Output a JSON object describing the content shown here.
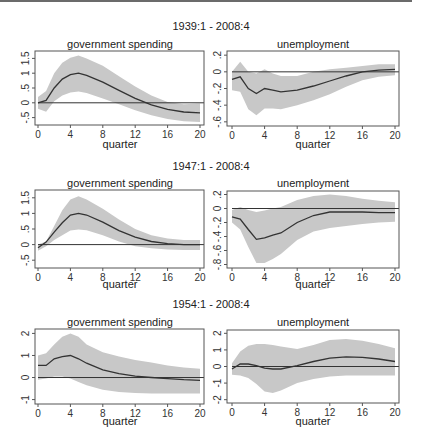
{
  "chart_data": [
    {
      "type": "line",
      "row_title": "1939:1 - 2008:4",
      "title": "government spending",
      "xlabel": "quarter",
      "ylabel": "",
      "x": [
        0,
        1,
        2,
        3,
        4,
        5,
        6,
        8,
        10,
        12,
        14,
        16,
        18,
        20
      ],
      "xticks": [
        "0",
        "4",
        "8",
        "12",
        "16",
        "20"
      ],
      "yticks": [
        1.5,
        1,
        0.5,
        0,
        -0.5
      ],
      "ytick_labels": [
        "1.5",
        "1",
        ".5",
        "0",
        "-.5"
      ],
      "ylim": [
        -0.75,
        1.75
      ],
      "zero_line": true,
      "series": [
        {
          "name": "response",
          "values": [
            0,
            0.08,
            0.5,
            0.8,
            0.95,
            1.0,
            0.93,
            0.7,
            0.42,
            0.15,
            -0.07,
            -0.22,
            -0.31,
            -0.34
          ]
        },
        {
          "name": "upper band",
          "values": [
            0.2,
            0.4,
            1.0,
            1.35,
            1.52,
            1.6,
            1.5,
            1.25,
            0.9,
            0.55,
            0.25,
            0.03,
            -0.05,
            -0.02
          ]
        },
        {
          "name": "lower band",
          "values": [
            -0.2,
            -0.3,
            0.05,
            0.25,
            0.35,
            0.38,
            0.33,
            0.15,
            -0.05,
            -0.25,
            -0.42,
            -0.55,
            -0.62,
            -0.65
          ]
        }
      ]
    },
    {
      "type": "line",
      "row_title": "1939:1 - 2008:4",
      "title": "unemployment",
      "xlabel": "quarter",
      "ylabel": "",
      "x": [
        0,
        1,
        2,
        3,
        4,
        5,
        6,
        8,
        10,
        12,
        14,
        16,
        18,
        20
      ],
      "xticks": [
        "0",
        "4",
        "8",
        "12",
        "16",
        "20"
      ],
      "yticks": [
        0.2,
        0,
        -0.2,
        -0.4,
        -0.6
      ],
      "ytick_labels": [
        ".2",
        "0",
        "-.2",
        "-.4",
        "-.6"
      ],
      "ylim": [
        -0.65,
        0.25
      ],
      "zero_line": true,
      "series": [
        {
          "name": "response",
          "values": [
            -0.09,
            -0.06,
            -0.2,
            -0.26,
            -0.2,
            -0.22,
            -0.24,
            -0.22,
            -0.17,
            -0.11,
            -0.05,
            0.0,
            0.02,
            0.03
          ]
        },
        {
          "name": "upper band",
          "values": [
            0.0,
            0.12,
            0.0,
            -0.02,
            0.03,
            -0.02,
            -0.05,
            -0.05,
            0.0,
            0.03,
            0.05,
            0.07,
            0.09,
            0.09
          ]
        },
        {
          "name": "lower band",
          "values": [
            -0.22,
            -0.24,
            -0.45,
            -0.52,
            -0.44,
            -0.44,
            -0.45,
            -0.4,
            -0.34,
            -0.27,
            -0.18,
            -0.1,
            -0.06,
            -0.04
          ]
        }
      ]
    },
    {
      "type": "line",
      "row_title": "1947:1 - 2008:4",
      "title": "government spending",
      "xlabel": "quarter",
      "ylabel": "",
      "x": [
        0,
        1,
        2,
        3,
        4,
        5,
        6,
        8,
        10,
        12,
        14,
        16,
        18,
        20
      ],
      "xticks": [
        "0",
        "4",
        "8",
        "12",
        "16",
        "20"
      ],
      "yticks": [
        1.5,
        1,
        0.5,
        0,
        -0.5
      ],
      "ytick_labels": [
        "1.5",
        "1",
        ".5",
        "0",
        "-.5"
      ],
      "ylim": [
        -0.75,
        1.75
      ],
      "zero_line": true,
      "series": [
        {
          "name": "response",
          "values": [
            -0.1,
            0.08,
            0.4,
            0.7,
            0.95,
            1.0,
            0.95,
            0.72,
            0.45,
            0.24,
            0.1,
            0.03,
            0.0,
            0.0
          ]
        },
        {
          "name": "upper band",
          "values": [
            0.0,
            0.1,
            0.6,
            1.1,
            1.45,
            1.55,
            1.45,
            1.15,
            0.8,
            0.5,
            0.3,
            0.2,
            0.15,
            0.15
          ]
        },
        {
          "name": "lower band",
          "values": [
            -0.2,
            -0.05,
            0.15,
            0.3,
            0.45,
            0.48,
            0.46,
            0.3,
            0.1,
            -0.05,
            -0.12,
            -0.16,
            -0.17,
            -0.17
          ]
        }
      ]
    },
    {
      "type": "line",
      "row_title": "1947:1 - 2008:4",
      "title": "unemployment",
      "xlabel": "quarter",
      "ylabel": "",
      "x": [
        0,
        1,
        2,
        3,
        4,
        5,
        6,
        8,
        10,
        12,
        14,
        16,
        18,
        20
      ],
      "xticks": [
        "0",
        "4",
        "8",
        "12",
        "16",
        "20"
      ],
      "yticks": [
        0.2,
        0,
        -0.2,
        -0.4,
        -0.6,
        -0.8
      ],
      "ytick_labels": [
        ".2",
        "0",
        "-.2",
        "-.4",
        "-.6",
        "-.8"
      ],
      "ylim": [
        -0.85,
        0.25
      ],
      "zero_line": true,
      "series": [
        {
          "name": "response",
          "values": [
            -0.12,
            -0.15,
            -0.3,
            -0.44,
            -0.42,
            -0.38,
            -0.35,
            -0.2,
            -0.1,
            -0.05,
            -0.05,
            -0.05,
            -0.06,
            -0.06
          ]
        },
        {
          "name": "upper band",
          "values": [
            -0.02,
            0.02,
            -0.02,
            -0.05,
            -0.03,
            0.0,
            0.02,
            0.12,
            0.18,
            0.2,
            0.18,
            0.14,
            0.11,
            0.09
          ]
        },
        {
          "name": "lower band",
          "values": [
            -0.2,
            -0.3,
            -0.55,
            -0.78,
            -0.78,
            -0.72,
            -0.65,
            -0.45,
            -0.33,
            -0.28,
            -0.25,
            -0.22,
            -0.2,
            -0.19
          ]
        }
      ]
    },
    {
      "type": "line",
      "row_title": "1954:1 - 2008:4",
      "title": "government spending",
      "xlabel": "quarter",
      "ylabel": "",
      "x": [
        0,
        1,
        2,
        3,
        4,
        5,
        6,
        8,
        10,
        12,
        14,
        16,
        18,
        20
      ],
      "xticks": [
        "0",
        "4",
        "8",
        "12",
        "16",
        "20"
      ],
      "yticks": [
        2,
        1,
        0,
        -1
      ],
      "ytick_labels": [
        "2",
        "1",
        "0",
        "-1"
      ],
      "ylim": [
        -1.2,
        2.2
      ],
      "zero_line": true,
      "series": [
        {
          "name": "response",
          "values": [
            0.55,
            0.55,
            0.85,
            0.95,
            1.0,
            0.85,
            0.65,
            0.35,
            0.18,
            0.06,
            0.0,
            -0.05,
            -0.1,
            -0.13
          ]
        },
        {
          "name": "upper band",
          "values": [
            1.0,
            1.1,
            1.5,
            1.85,
            2.0,
            1.85,
            1.5,
            1.15,
            0.95,
            0.8,
            0.68,
            0.55,
            0.45,
            0.4
          ]
        },
        {
          "name": "lower band",
          "values": [
            -0.1,
            -0.05,
            0.05,
            0.05,
            -0.05,
            -0.2,
            -0.35,
            -0.55,
            -0.65,
            -0.7,
            -0.72,
            -0.72,
            -0.72,
            -0.72
          ]
        }
      ]
    },
    {
      "type": "line",
      "row_title": "1954:1 - 2008:4",
      "title": "unemployment",
      "xlabel": "quarter",
      "ylabel": "",
      "x": [
        0,
        1,
        2,
        3,
        4,
        5,
        6,
        8,
        10,
        12,
        14,
        16,
        18,
        20
      ],
      "xticks": [
        "0",
        "4",
        "8",
        "12",
        "16",
        "20"
      ],
      "yticks": [
        2,
        1,
        0,
        -1,
        -2
      ],
      "ytick_labels": [
        "2",
        "1",
        "0",
        "-1",
        "-2"
      ],
      "ylim": [
        -2.2,
        2.2
      ],
      "zero_line": true,
      "series": [
        {
          "name": "response",
          "values": [
            -0.15,
            0.15,
            0.15,
            0.05,
            -0.1,
            -0.15,
            -0.15,
            0.05,
            0.3,
            0.5,
            0.58,
            0.55,
            0.45,
            0.3
          ]
        },
        {
          "name": "upper band",
          "values": [
            0.2,
            0.9,
            1.25,
            1.35,
            1.35,
            1.3,
            1.2,
            1.05,
            1.3,
            1.6,
            1.65,
            1.55,
            1.35,
            1.1
          ]
        },
        {
          "name": "lower band",
          "values": [
            -0.5,
            -0.55,
            -0.7,
            -1.05,
            -1.5,
            -1.6,
            -1.45,
            -1.0,
            -0.75,
            -0.6,
            -0.55,
            -0.55,
            -0.55,
            -0.55
          ]
        }
      ]
    }
  ],
  "rows": [
    {
      "title": "1939:1 - 2008:4"
    },
    {
      "title": "1947:1 - 2008:4"
    },
    {
      "title": "1954:1 - 2008:4"
    }
  ],
  "panels": [
    {
      "title": "government spending",
      "xlabel": "quarter"
    },
    {
      "title": "unemployment",
      "xlabel": "quarter"
    },
    {
      "title": "government spending",
      "xlabel": "quarter"
    },
    {
      "title": "unemployment",
      "xlabel": "quarter"
    },
    {
      "title": "government spending",
      "xlabel": "quarter"
    },
    {
      "title": "unemployment",
      "xlabel": "quarter"
    }
  ],
  "colors": {
    "band": "#c8c8c8",
    "line": "#333333",
    "axis": "#555555",
    "zero": "#333333"
  }
}
